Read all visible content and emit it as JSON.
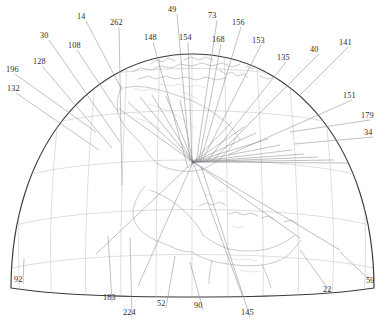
{
  "figure": {
    "kind": "patent-figure",
    "width": 385,
    "height": 330,
    "background_color": "#ffffff",
    "outline_color": "#3a3a3a",
    "graticule_color": "#b9bcc2",
    "coastline_color": "#9aa0a6",
    "leader_color": "#8d8d8d",
    "label_color": "#2b2b2b"
  },
  "callouts": [
    {
      "id": "c196",
      "text": "196",
      "lx": 6,
      "ly": 72,
      "tx": 96,
      "ty": 132,
      "anchor": "start"
    },
    {
      "id": "c132",
      "text": "132",
      "lx": 7,
      "ly": 91,
      "tx": 99,
      "ty": 150,
      "anchor": "start"
    },
    {
      "id": "c128",
      "text": "128",
      "lx": 33,
      "ly": 64,
      "tx": 112,
      "ty": 148,
      "anchor": "start"
    },
    {
      "id": "c30",
      "text": "30",
      "lx": 40,
      "ly": 38,
      "tx": 120,
      "ty": 142,
      "anchor": "start"
    },
    {
      "id": "c108",
      "text": "108",
      "lx": 68,
      "ly": 48,
      "tx": 118,
      "ty": 112,
      "anchor": "start"
    },
    {
      "id": "c14",
      "text": "14",
      "lx": 77,
      "ly": 19,
      "tx": 122,
      "ty": 90,
      "anchor": "start"
    },
    {
      "id": "c262",
      "text": "262",
      "lx": 110,
      "ly": 25,
      "tx": 122,
      "ty": 185,
      "anchor": "start"
    },
    {
      "id": "c148",
      "text": "148",
      "lx": 144,
      "ly": 40,
      "tx": 188,
      "ty": 168,
      "anchor": "start"
    },
    {
      "id": "c49",
      "text": "49",
      "lx": 168,
      "ly": 12,
      "tx": 190,
      "ty": 162,
      "anchor": "start"
    },
    {
      "id": "c154",
      "text": "154",
      "lx": 179,
      "ly": 40,
      "tx": 192,
      "ty": 165,
      "anchor": "start"
    },
    {
      "id": "c73",
      "text": "73",
      "lx": 208,
      "ly": 18,
      "tx": 196,
      "ty": 164,
      "anchor": "start"
    },
    {
      "id": "c168",
      "text": "168",
      "lx": 212,
      "ly": 42,
      "tx": 199,
      "ty": 160,
      "anchor": "start"
    },
    {
      "id": "c156",
      "text": "156",
      "lx": 232,
      "ly": 25,
      "tx": 200,
      "ty": 162,
      "anchor": "start"
    },
    {
      "id": "c153",
      "text": "153",
      "lx": 252,
      "ly": 43,
      "tx": 203,
      "ty": 159,
      "anchor": "start"
    },
    {
      "id": "c135",
      "text": "135",
      "lx": 277,
      "ly": 60,
      "tx": 207,
      "ty": 161,
      "anchor": "start"
    },
    {
      "id": "c40",
      "text": "40",
      "lx": 310,
      "ly": 52,
      "tx": 213,
      "ty": 160,
      "anchor": "start"
    },
    {
      "id": "c141",
      "text": "141",
      "lx": 339,
      "ly": 45,
      "tx": 300,
      "ty": 95,
      "anchor": "start"
    },
    {
      "id": "c151",
      "text": "151",
      "lx": 343,
      "ly": 98,
      "tx": 228,
      "ty": 155,
      "anchor": "start"
    },
    {
      "id": "c179",
      "text": "179",
      "lx": 361,
      "ly": 118,
      "tx": 290,
      "ty": 132,
      "anchor": "start"
    },
    {
      "id": "c34",
      "text": "34",
      "lx": 364,
      "ly": 135,
      "tx": 294,
      "ty": 144,
      "anchor": "start"
    },
    {
      "id": "c59",
      "text": "59",
      "lx": 366,
      "ly": 283,
      "tx": 340,
      "ty": 252,
      "anchor": "start"
    },
    {
      "id": "c22",
      "text": "22",
      "lx": 323,
      "ly": 292,
      "tx": 300,
      "ty": 250,
      "anchor": "start"
    },
    {
      "id": "c145",
      "text": "145",
      "lx": 241,
      "ly": 315,
      "tx": 201,
      "ty": 166,
      "anchor": "start"
    },
    {
      "id": "c90",
      "text": "90",
      "lx": 194,
      "ly": 308,
      "tx": 190,
      "ty": 262,
      "anchor": "start"
    },
    {
      "id": "c52",
      "text": "52",
      "lx": 157,
      "ly": 306,
      "tx": 175,
      "ty": 256,
      "anchor": "start"
    },
    {
      "id": "c224",
      "text": "224",
      "lx": 123,
      "ly": 315,
      "tx": 130,
      "ty": 238,
      "anchor": "start"
    },
    {
      "id": "c183",
      "text": "183",
      "lx": 103,
      "ly": 300,
      "tx": 108,
      "ty": 236,
      "anchor": "start"
    },
    {
      "id": "c92",
      "text": "92",
      "lx": 14,
      "ly": 282,
      "tx": 24,
      "ty": 258,
      "anchor": "start"
    }
  ],
  "convergence": {
    "x": 193,
    "y": 162,
    "label": "ray-convergence-node"
  },
  "rays": [
    {
      "x2": 118,
      "y2": 108
    },
    {
      "x2": 128,
      "y2": 102
    },
    {
      "x2": 140,
      "y2": 97
    },
    {
      "x2": 152,
      "y2": 95
    },
    {
      "x2": 166,
      "y2": 96
    },
    {
      "x2": 180,
      "y2": 100
    },
    {
      "x2": 232,
      "y2": 122
    },
    {
      "x2": 244,
      "y2": 127
    },
    {
      "x2": 256,
      "y2": 133
    },
    {
      "x2": 268,
      "y2": 139
    },
    {
      "x2": 280,
      "y2": 145
    },
    {
      "x2": 292,
      "y2": 150
    },
    {
      "x2": 304,
      "y2": 154
    },
    {
      "x2": 318,
      "y2": 157
    },
    {
      "x2": 334,
      "y2": 160
    },
    {
      "x2": 348,
      "y2": 163
    },
    {
      "x2": 300,
      "y2": 238
    },
    {
      "x2": 340,
      "y2": 250
    },
    {
      "x2": 244,
      "y2": 300
    },
    {
      "x2": 138,
      "y2": 286
    },
    {
      "x2": 96,
      "y2": 254
    }
  ],
  "graticule": {
    "meridian_count": 11,
    "parallel_count": 5,
    "visible": true
  },
  "landmasses": [
    "north-america",
    "greenland",
    "central-america",
    "caribbean-islands",
    "south-america",
    "canadian-arctic"
  ]
}
